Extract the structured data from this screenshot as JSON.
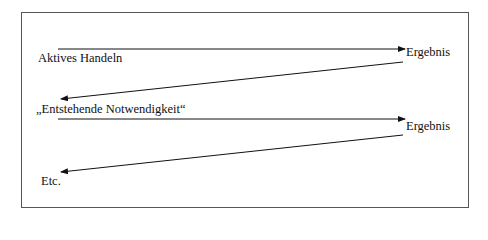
{
  "diagram": {
    "labels": {
      "active_action": "Aktives Handeln",
      "result_1": "Ergebnis",
      "emerging_necessity": "„Entstehende Notwendigkeit“",
      "result_2": "Ergebnis",
      "etc": "Etc."
    },
    "edges": [
      {
        "from": "active_action",
        "to": "result_1"
      },
      {
        "from": "result_1",
        "to": "emerging_necessity"
      },
      {
        "from": "emerging_necessity",
        "to": "result_2"
      },
      {
        "from": "result_2",
        "to": "etc"
      }
    ],
    "colors": {
      "stroke": "#111111",
      "frame": "#555555"
    }
  }
}
